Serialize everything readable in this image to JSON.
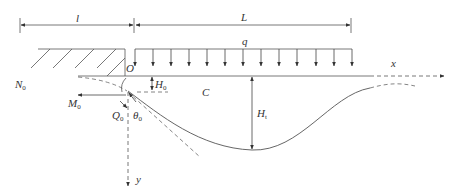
{
  "diagram": {
    "type": "beam on elastic foundation / overburden deflection diagram",
    "colors": {
      "line": "#555555",
      "dashed": "#666666",
      "text": "#333333"
    },
    "labels": {
      "l": "l",
      "L": "L",
      "q": "q",
      "x": "x",
      "y": "y",
      "O": "O",
      "C": "C",
      "N0": "N",
      "N0_sub": "0",
      "M0": "M",
      "M0_sub": "0",
      "Q0": "Q",
      "Q0_sub": "0",
      "theta0": "θ",
      "theta0_sub": "0",
      "H0": "H",
      "H0_sub": "0",
      "Ht": "H",
      "Ht_sub": "t"
    },
    "dimensions": [
      {
        "name": "l",
        "from_x": 20,
        "to_x": 134,
        "y": 25
      },
      {
        "name": "L",
        "from_x": 135,
        "to_x": 352,
        "y": 25
      }
    ],
    "distributed_load": {
      "label": "q",
      "arrow_count": 13,
      "from_x": 135,
      "to_x": 352
    }
  }
}
